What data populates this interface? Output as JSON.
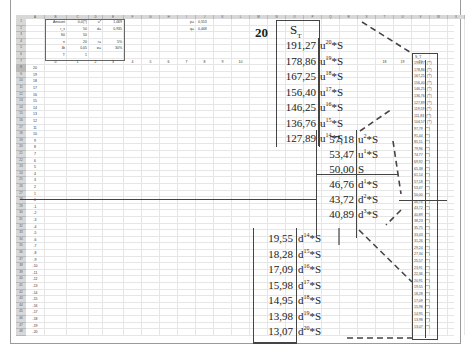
{
  "sheet": {
    "columns": [
      "A",
      "B",
      "C",
      "D",
      "E",
      "F",
      "G",
      "H",
      "I",
      "J",
      "K",
      "L",
      "M",
      "N",
      "O",
      "P",
      "Q",
      "R",
      "S",
      "T",
      "U",
      "V",
      "W",
      "X"
    ],
    "rows_count": 48,
    "params_block": [
      {
        "label": "Amount",
        "value": "0,0(?)",
        "label2": "u*",
        "value2": "1,069"
      },
      {
        "label": "r_s",
        "value": "50",
        "label2": "d=",
        "value2": "0,935"
      },
      {
        "label": "S0",
        "value": "50",
        "label2": "",
        "value2": ""
      },
      {
        "label": "n",
        "value": "20",
        "label2": "r=",
        "value2": "5%"
      },
      {
        "label": "Δt",
        "value": "0,05",
        "label2": "σ=",
        "value2": "30%"
      },
      {
        "label": "T",
        "value": "1",
        "label2": "",
        "value2": ""
      }
    ],
    "params_right": [
      {
        "label": "p=",
        "value": "0,553"
      },
      {
        "label": "q=",
        "value": "0,448"
      }
    ],
    "step_index_row": [
      "0",
      "1",
      "2",
      "3",
      "4",
      "5",
      "6",
      "7",
      "8",
      "9",
      "10"
    ],
    "step_index_right": [
      "18",
      "19",
      "20"
    ],
    "row_level_labels": [
      "20",
      "19",
      "18",
      "17",
      "16",
      "15",
      "14",
      "13",
      "12",
      "11",
      "10",
      "9",
      "8",
      "7",
      "6",
      "5",
      "4",
      "3",
      "2",
      "1",
      "0",
      "-1",
      "-2",
      "-3",
      "-4",
      "-5",
      "-6",
      "-7",
      "-8",
      "-9",
      "-10",
      "-11",
      "-12",
      "-13",
      "-14",
      "-15",
      "-16",
      "-17",
      "-18",
      "-19",
      "-20"
    ]
  },
  "overlay": {
    "step_label": "20",
    "header": "S",
    "header_sub": "T",
    "upper_values": [
      {
        "value": "191,27",
        "base": "u",
        "exp": "20",
        "suffix": "*S"
      },
      {
        "value": "178,86",
        "base": "u",
        "exp": "19",
        "suffix": "*S"
      },
      {
        "value": "167,25",
        "base": "u",
        "exp": "18",
        "suffix": "*S"
      },
      {
        "value": "156,40",
        "base": "u",
        "exp": "17",
        "suffix": "*S"
      },
      {
        "value": "146,25",
        "base": "u",
        "exp": "16",
        "suffix": "*S"
      },
      {
        "value": "136,76",
        "base": "u",
        "exp": "15",
        "suffix": "*S"
      },
      {
        "value": "127,89",
        "base": "u",
        "exp": "14",
        "suffix": "*S"
      }
    ],
    "middle_values": [
      {
        "value": "57,18",
        "base": "u",
        "exp": "2",
        "suffix": "*S"
      },
      {
        "value": "53,47",
        "base": "u",
        "exp": "1",
        "suffix": "*S"
      },
      {
        "value": "50,00",
        "base": "S",
        "exp": "",
        "suffix": ""
      },
      {
        "value": "46,76",
        "base": "d",
        "exp": "1",
        "suffix": "*S"
      },
      {
        "value": "43,72",
        "base": "d",
        "exp": "2",
        "suffix": "*S"
      },
      {
        "value": "40,89",
        "base": "d",
        "exp": "3",
        "suffix": "*S"
      }
    ],
    "lower_values": [
      {
        "value": "19,55",
        "base": "d",
        "exp": "14",
        "suffix": "*S"
      },
      {
        "value": "18,28",
        "base": "d",
        "exp": "15",
        "suffix": "*S"
      },
      {
        "value": "17,09",
        "base": "d",
        "exp": "16",
        "suffix": "*S"
      },
      {
        "value": "15,98",
        "base": "d",
        "exp": "17",
        "suffix": "*S"
      },
      {
        "value": "14,95",
        "base": "d",
        "exp": "18",
        "suffix": "*S"
      },
      {
        "value": "13,98",
        "base": "d",
        "exp": "19",
        "suffix": "*S"
      },
      {
        "value": "13,07",
        "base": "d",
        "exp": "20",
        "suffix": "*S"
      }
    ]
  },
  "right_column": {
    "header": "S_T",
    "values": [
      "191,27",
      "178,86",
      "167,25",
      "156,40",
      "146,25",
      "136,76",
      "127,89",
      "119,59",
      "111,83",
      "104,57",
      "97,79",
      "91,44",
      "85,51",
      "79,96",
      "74,77",
      "69,92",
      "65,38",
      "61,14",
      "57,18",
      "53,47",
      "50,00",
      "46,76",
      "43,72",
      "40,89",
      "38,23",
      "35,75",
      "33,43",
      "31,26",
      "29,24",
      "27,34",
      "25,57",
      "23,91",
      "22,36",
      "20,91",
      "19,55",
      "18,28",
      "17,09",
      "15,98",
      "14,95",
      "13,98",
      "13,07"
    ],
    "suffix": "(**)"
  }
}
